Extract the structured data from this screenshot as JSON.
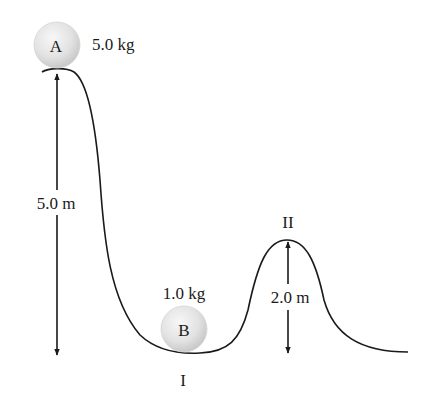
{
  "diagram": {
    "type": "roller-coaster-track-energy-problem",
    "colors": {
      "track": "#1a1a1a",
      "arrow": "#1a1a1a",
      "ball_fill_light": "#f4f4f4",
      "ball_fill_dark": "#c8c8c8",
      "text": "#1a1a1a"
    },
    "ball_a": {
      "label": "A",
      "mass": "5.0 kg"
    },
    "ball_b": {
      "label": "B",
      "mass": "1.0 kg"
    },
    "points": {
      "valley_label": "I",
      "hill_label": "II"
    },
    "dimensions": {
      "start_height": "5.0 m",
      "hill_height": "2.0 m"
    }
  }
}
